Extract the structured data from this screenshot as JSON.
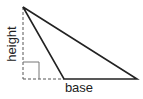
{
  "diagram": {
    "type": "triangle-area",
    "labels": {
      "height": "height",
      "base": "base"
    },
    "colors": {
      "stroke": "#222222",
      "dashed": "#555555",
      "background": "#ffffff"
    }
  }
}
